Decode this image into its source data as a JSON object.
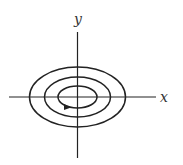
{
  "diagram": {
    "type": "phase-portrait",
    "axes": {
      "x_label": "x",
      "y_label": "y"
    },
    "orbits": [
      {
        "name": "inner",
        "rx": 19.5,
        "ry": 11
      },
      {
        "name": "middle",
        "rx": 33,
        "ry": 20
      },
      {
        "name": "outer",
        "rx": 48,
        "ry": 30
      }
    ],
    "arrow": {
      "on": "inner",
      "direction": "counterclockwise"
    },
    "colors": {
      "stroke": "#222222",
      "background": "#ffffff"
    }
  }
}
